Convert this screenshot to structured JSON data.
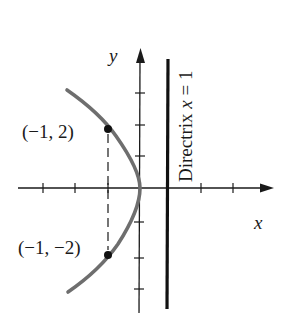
{
  "figure": {
    "type": "parabola-diagram",
    "equation_implied": "y^2 = -4x",
    "axes": {
      "x_label": "x",
      "y_label": "y",
      "origin_px": [
        140,
        188
      ],
      "unit_px": 32,
      "x_ticks": [
        -3,
        -2,
        -1,
        1,
        2
      ],
      "y_ticks": [
        -3,
        -2,
        -1,
        1,
        2,
        3
      ]
    },
    "directrix": {
      "label_prefix": "Directrix ",
      "label_var": "x",
      "label_suffix": " = 1",
      "x_value": 1
    },
    "points": [
      {
        "label": "(−1, 2)",
        "x": -1,
        "y": 2
      },
      {
        "label": "(−1, −2)",
        "x": -1,
        "y": -2
      }
    ],
    "colors": {
      "curve": "#6e6e6e",
      "ink": "#1a1a1a"
    }
  }
}
